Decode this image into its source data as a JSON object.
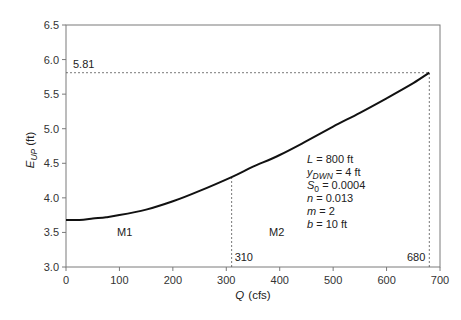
{
  "chart_data": {
    "type": "line",
    "title": "",
    "xlabel": "Q (cfs)",
    "xlabel_italic": "Q",
    "xlabel_unit": "(cfs)",
    "ylabel": "E_UP (ft)",
    "ylabel_main": "E",
    "ylabel_sub": "UP",
    "ylabel_unit": "(ft)",
    "xlim": [
      0,
      700
    ],
    "ylim": [
      3.0,
      6.5
    ],
    "x_ticks": [
      0,
      100,
      200,
      300,
      400,
      500,
      600,
      700
    ],
    "y_ticks": [
      "3.0",
      "3.5",
      "4.0",
      "4.5",
      "5.0",
      "5.5",
      "6.0",
      "6.5"
    ],
    "grid": false,
    "legend": null,
    "series": [
      {
        "name": "E_UP vs Q",
        "x": [
          0,
          25,
          50,
          75,
          100,
          150,
          200,
          250,
          310,
          350,
          400,
          450,
          500,
          550,
          600,
          650,
          680
        ],
        "y": [
          3.68,
          3.68,
          3.7,
          3.72,
          3.75,
          3.83,
          3.95,
          4.1,
          4.3,
          4.45,
          4.62,
          4.82,
          5.03,
          5.23,
          5.44,
          5.66,
          5.81
        ]
      }
    ],
    "reference_lines": [
      {
        "type": "horizontal",
        "y": 5.81,
        "x_end": 680,
        "label": "5.81",
        "style": "dashed"
      },
      {
        "type": "vertical",
        "x": 310,
        "y_end": 4.3,
        "label": "310",
        "style": "dashed"
      },
      {
        "type": "vertical",
        "x": 680,
        "y_end": 5.81,
        "label": "680",
        "style": "dashed"
      }
    ],
    "region_labels": [
      {
        "text": "M1",
        "x": 120,
        "y": 3.45
      },
      {
        "text": "M2",
        "x": 390,
        "y": 3.45
      }
    ],
    "annotations": [
      {
        "var": "L",
        "rest": " = 800 ft"
      },
      {
        "var": "y",
        "sub": "DWN",
        "rest": " = 4 ft"
      },
      {
        "var": "S",
        "sub": "0",
        "rest": " = 0.0004"
      },
      {
        "var": "n",
        "rest": " = 0.013"
      },
      {
        "var": "m",
        "rest": " = 2"
      },
      {
        "var": "b",
        "rest": " = 10 ft"
      }
    ]
  }
}
